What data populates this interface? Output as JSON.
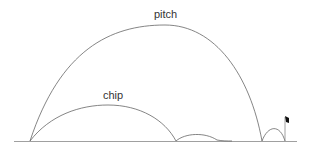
{
  "diagram": {
    "labels": {
      "pitch": "pitch",
      "chip": "chip"
    },
    "colors": {
      "line": "#666666",
      "ground": "#888888",
      "flag": "#111111",
      "text": "#333333"
    }
  }
}
